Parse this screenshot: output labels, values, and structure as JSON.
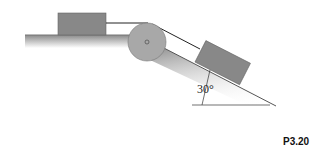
{
  "figure": {
    "label": "P3.20",
    "angle_label": "30°",
    "components": [
      "horizontal-surface",
      "block-on-horizontal",
      "pulley",
      "rope",
      "incline-30deg",
      "block-on-incline"
    ],
    "colors": {
      "block": "#888888",
      "pulley": "#a8a8a8",
      "surface": "#9a9a9a",
      "line": "#222222"
    }
  }
}
